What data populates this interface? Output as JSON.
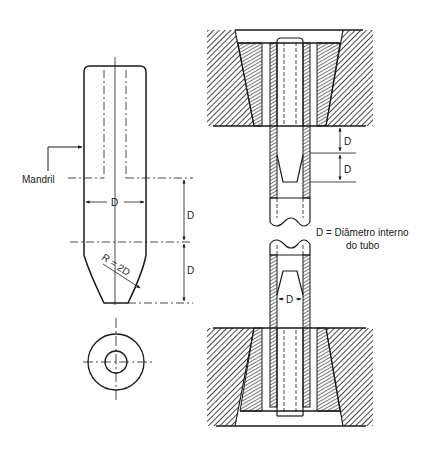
{
  "figure": {
    "type": "technical-drawing",
    "labels": {
      "mandrel": "Mandril",
      "mandrel_width": "D",
      "mandrel_upper_len": "D",
      "mandrel_lower_len": "D",
      "radius": "R = 2D",
      "die_gap_1": "D",
      "die_gap_2": "D",
      "tube_inner": "D",
      "legend_line1": "D = Diâmetro interno",
      "legend_line2": "do tubo"
    },
    "colors": {
      "ink": "#1a1a1a",
      "background": "#ffffff"
    }
  }
}
